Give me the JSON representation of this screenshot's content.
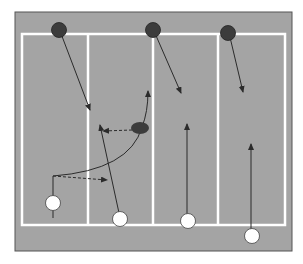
{
  "diagram": {
    "title": "",
    "colors": {
      "field": "#a4a4a4",
      "field_border": "#555555",
      "court_lines": "#ffffff",
      "offense_player": "#ffffff",
      "defense_player": "#3c3c3c",
      "ball": "#3c3c3c",
      "arrow": "#2b2b2b"
    },
    "lanes": 4,
    "players": {
      "defense": [
        {
          "id": "D1",
          "role": "defender"
        },
        {
          "id": "D2",
          "role": "defender"
        },
        {
          "id": "D3",
          "role": "defender"
        }
      ],
      "offense": [
        {
          "id": "O1",
          "role": "ball-carrier-start"
        },
        {
          "id": "O2",
          "role": "attacker"
        },
        {
          "id": "O3",
          "role": "attacker"
        },
        {
          "id": "O4",
          "role": "attacker"
        }
      ]
    },
    "ball": {
      "shape": "oval"
    },
    "movements": [
      {
        "from": "D1",
        "type": "run"
      },
      {
        "from": "D2",
        "type": "run"
      },
      {
        "from": "D3",
        "type": "run"
      },
      {
        "from": "O1",
        "type": "curved-run-to-ball"
      },
      {
        "from": "O1",
        "type": "pass",
        "style": "dashed"
      },
      {
        "from": "ball",
        "type": "pass",
        "style": "dashed"
      },
      {
        "from": "O2",
        "type": "run"
      },
      {
        "from": "O3",
        "type": "run"
      },
      {
        "from": "O4",
        "type": "run"
      }
    ]
  }
}
